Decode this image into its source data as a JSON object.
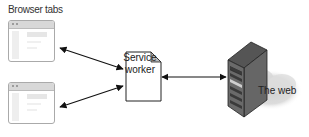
{
  "diagram": {
    "title": "Browser tabs",
    "nodes": [
      {
        "id": "tab1",
        "type": "browser-window"
      },
      {
        "id": "tab2",
        "type": "browser-window"
      },
      {
        "id": "sw",
        "type": "document",
        "label_line1": "Service",
        "label_line2": "worker"
      },
      {
        "id": "server",
        "type": "server"
      },
      {
        "id": "web",
        "type": "cloud",
        "label": "The web"
      }
    ],
    "edges": [
      {
        "from": "tab1",
        "to": "sw",
        "bidirectional": true
      },
      {
        "from": "tab2",
        "to": "sw",
        "bidirectional": true
      },
      {
        "from": "sw",
        "to": "server",
        "bidirectional": true
      }
    ]
  }
}
